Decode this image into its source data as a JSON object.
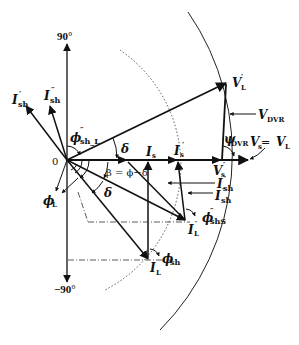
{
  "diagram": {
    "type": "phasor-diagram",
    "axis_labels": {
      "top": "90°",
      "bottom": "−90°",
      "origin": "0"
    },
    "phasors": {
      "I_sh_prime": {
        "main": "I",
        "sub": "sh",
        "sup": "′"
      },
      "I_sh_dprime": {
        "main": "I",
        "sub": "sh",
        "sup": "″"
      },
      "phi_sh_L": {
        "main": "ϕ",
        "sub": "sh_L",
        "sup": "″"
      },
      "delta_top": "δ",
      "I_s": {
        "main": "I",
        "sub": "s"
      },
      "I_s_prime": {
        "main": "I",
        "sub": "s",
        "sup": "′"
      },
      "V_L_prime": {
        "main": "V",
        "sub": "L",
        "sup": "′"
      },
      "V_DVR": {
        "main": "V",
        "sub": "DVR"
      },
      "psi_DVR": {
        "main": "ψ",
        "sub": "DVR"
      },
      "Vs_eq_VL": {
        "left": "V",
        "left_sub": "s",
        "eq": " = ",
        "right": "V",
        "right_sub": "L"
      },
      "V_s_prime": {
        "main": "V",
        "sub": "s",
        "sup": "′"
      },
      "I_sh_prime_right": {
        "main": "I",
        "sub": "sh",
        "sup": "′"
      },
      "I_sh_dprime_right": {
        "main": "I",
        "sub": "sh",
        "sup": "″"
      },
      "beta": "β = ϕ−δ",
      "delta_bottom": "δ",
      "phi_L": {
        "main": "ϕ",
        "sub": "L"
      },
      "phi_shS": {
        "main": "ϕ",
        "sub": "shS",
        "sup": "″"
      },
      "I_L_prime": {
        "main": "I",
        "sub": "L",
        "sup": "′"
      },
      "phi_sh": {
        "main": "ϕ",
        "sub": "sh"
      },
      "I_L": {
        "main": "I",
        "sub": "L"
      }
    }
  }
}
